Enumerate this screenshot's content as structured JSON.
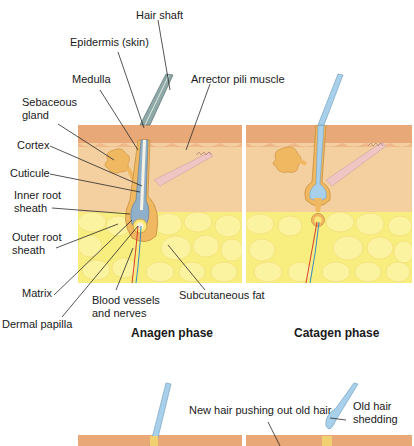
{
  "diagram": {
    "labels": {
      "hair_shaft": "Hair shaft",
      "epidermis": "Epidermis (skin)",
      "medulla": "Medulla",
      "arrector": "Arrector pili muscle",
      "sebaceous_1": "Sebaceous",
      "sebaceous_2": "gland",
      "cortex": "Cortex",
      "cuticle": "Cuticule",
      "irs_1": "Inner root",
      "irs_2": "sheath",
      "ors_1": "Outer root",
      "ors_2": "sheath",
      "matrix": "Matrix",
      "blood_1": "Blood vessels",
      "blood_2": "and nerves",
      "fat": "Subcutaneous fat",
      "papilla": "Dermal papilla",
      "new_hair": "New hair pushing out old hair",
      "old_1": "Old hair",
      "old_2": "shedding"
    },
    "phases": [
      {
        "name": "Anagen phase"
      },
      {
        "name": "Catagen phase"
      }
    ],
    "colors": {
      "epidermis": "#e8a878",
      "dermis": "#f4cfa0",
      "fat": "#f8ee80",
      "fat_cells": "#fbf3a0",
      "follicle": "#f0b860",
      "hair_blue": "#a8d0ea",
      "muscle": "#efc6c4",
      "artery": "#d83a2a",
      "vein": "#3a8ac0"
    }
  }
}
